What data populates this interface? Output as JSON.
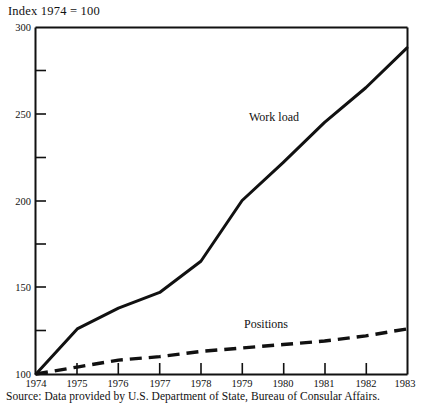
{
  "chart_data": {
    "type": "line",
    "title": "Index 1974 = 100",
    "xlabel": "",
    "ylabel": "",
    "x": [
      1974,
      1975,
      1976,
      1977,
      1978,
      1979,
      1980,
      1981,
      1982,
      1983
    ],
    "xtick_labels": [
      "1974",
      "1975",
      "1976",
      "1977",
      "1978",
      "1979",
      "1980",
      "1981",
      "1982",
      "1983"
    ],
    "ytick_labels": [
      "100",
      "150",
      "200",
      "250",
      "300"
    ],
    "yticks": [
      100,
      150,
      200,
      250,
      300
    ],
    "yminor_ticks": [
      125,
      175,
      225,
      275
    ],
    "ylim": [
      100,
      300
    ],
    "xlim": [
      1974,
      1983
    ],
    "grid": false,
    "legend_position": "inline-annotations",
    "series": [
      {
        "name": "Work load",
        "style": "solid",
        "color": "#111111",
        "values": [
          100,
          126,
          138,
          147,
          165,
          200,
          222,
          245,
          265,
          288
        ]
      },
      {
        "name": "Positions",
        "style": "dashed",
        "color": "#111111",
        "values": [
          100,
          104,
          108,
          110,
          113,
          115,
          117,
          119,
          122,
          126
        ]
      }
    ],
    "annotations": [
      {
        "text": "Work load",
        "x": 1979.4,
        "y": 243
      },
      {
        "text": "Positions",
        "x": 1979.2,
        "y": 132
      }
    ],
    "source": "Source: Data provided by U.S. Department of State, Bureau of Consular Affairs."
  }
}
